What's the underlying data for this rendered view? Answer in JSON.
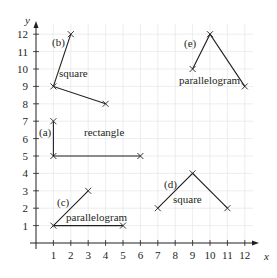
{
  "figure": {
    "axes": {
      "x_label": "x",
      "y_label": "y",
      "x_ticks": [
        "1",
        "2",
        "3",
        "4",
        "5",
        "6",
        "7",
        "8",
        "9",
        "10",
        "11",
        "12"
      ],
      "y_ticks": [
        "1",
        "2",
        "3",
        "4",
        "5",
        "6",
        "7",
        "8",
        "9",
        "10",
        "11",
        "12"
      ],
      "grid": true
    },
    "colors": {
      "grid": "#e8e8e8",
      "ink": "#231f20"
    },
    "shapes": [
      {
        "id": "a",
        "tag": "(a)",
        "name": "rectangle",
        "points": [
          [
            1,
            7
          ],
          [
            1,
            5
          ],
          [
            7,
            5
          ]
        ]
      },
      {
        "id": "b",
        "tag": "(b)",
        "name": "square",
        "points": [
          [
            2,
            12
          ],
          [
            1,
            9
          ],
          [
            4,
            8
          ]
        ]
      },
      {
        "id": "c",
        "tag": "(c)",
        "name": "parallelogram",
        "points": [
          [
            3,
            3
          ],
          [
            1,
            1
          ],
          [
            5,
            1
          ]
        ]
      },
      {
        "id": "d",
        "tag": "(d)",
        "name": "square",
        "points": [
          [
            7,
            2
          ],
          [
            9,
            4
          ],
          [
            11,
            2
          ]
        ]
      },
      {
        "id": "e",
        "tag": "(e)",
        "name": "parallelogram",
        "points": [
          [
            9,
            10
          ],
          [
            10,
            12
          ],
          [
            12,
            9
          ]
        ]
      }
    ]
  }
}
